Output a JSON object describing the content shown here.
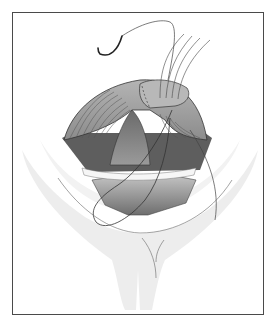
{
  "figure": {
    "type": "surgical-illustration",
    "text_labels": [],
    "colors": {
      "frame_border": "#4a4a4a",
      "background": "#ffffff",
      "soft_tissue": "#ececec",
      "tissue_fold": "#a8a8a8",
      "tissue_dark": "#7a7a7a",
      "cavity_dark": "#5e5e5e",
      "suture_line": "#333333",
      "needle": "#2a2a2a"
    }
  }
}
